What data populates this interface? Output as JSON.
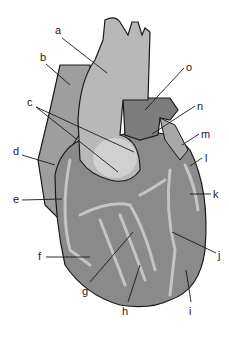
{
  "diagram": {
    "labels": [
      {
        "id": "a",
        "text": "a",
        "x": 57,
        "y": 29
      },
      {
        "id": "b",
        "text": "b",
        "x": 40,
        "y": 56
      },
      {
        "id": "c",
        "text": "c",
        "x": 27,
        "y": 101
      },
      {
        "id": "d",
        "text": "d",
        "x": 13,
        "y": 150
      },
      {
        "id": "e",
        "text": "e",
        "x": 13,
        "y": 195
      },
      {
        "id": "f",
        "text": "f",
        "x": 38,
        "y": 252
      },
      {
        "id": "g",
        "text": "g",
        "x": 82,
        "y": 287
      },
      {
        "id": "h",
        "text": "h",
        "x": 122,
        "y": 306
      },
      {
        "id": "i",
        "text": "i",
        "x": 188,
        "y": 306
      },
      {
        "id": "j",
        "text": "j",
        "x": 218,
        "y": 250
      },
      {
        "id": "k",
        "text": "k",
        "x": 213,
        "y": 190
      },
      {
        "id": "l",
        "text": "l",
        "x": 204,
        "y": 156
      },
      {
        "id": "m",
        "text": "m",
        "x": 201,
        "y": 131
      },
      {
        "id": "n",
        "text": "n",
        "x": 197,
        "y": 102
      },
      {
        "id": "o",
        "text": "o",
        "x": 186,
        "y": 63
      }
    ],
    "colors": {
      "ventricle": "#8a8a8a",
      "atrium": "#9e9e9e",
      "aorta": "#b8b8b8",
      "vessel": "#c4c4c4",
      "outline": "#1a1a1a",
      "pulmonary": "#7d7d7d"
    }
  }
}
